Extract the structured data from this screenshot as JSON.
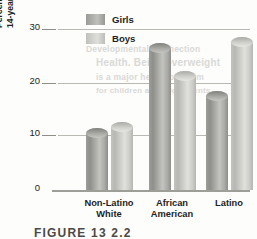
{
  "figure": {
    "caption": "FIGURE 13  2.2",
    "background_text": [
      "Developmental Connection",
      "Health. Being overweight",
      "is a major health problem",
      "for children and adolescents."
    ]
  },
  "chart_data": {
    "type": "bar",
    "title": "",
    "xlabel": "",
    "ylabel": "Percentage of overweight 11- to 14-year-olds in the United States",
    "ylabel_lines": [
      "Percentage of overweight 11- to",
      "14-year-olds in the United States"
    ],
    "categories": [
      "Non-Latino White",
      "African American",
      "Latino"
    ],
    "category_lines": [
      [
        "Non-Latino",
        "White"
      ],
      [
        "African",
        "American"
      ],
      [
        "Latino",
        ""
      ]
    ],
    "series": [
      {
        "name": "Girls",
        "color": "#9a9a96",
        "values": [
          11,
          26,
          17.5
        ]
      },
      {
        "name": "Boys",
        "color": "#c8c8c4",
        "values": [
          12,
          21,
          27
        ]
      }
    ],
    "ylim": [
      0,
      30
    ],
    "yticks": [
      0,
      10,
      20,
      30
    ],
    "ytick_labels": [
      "0",
      "10",
      "20",
      "30"
    ],
    "grid": true,
    "grid_lines_at": [
      10,
      20,
      30
    ],
    "legend": [
      "Girls",
      "Boys"
    ],
    "legend_position": "top-center"
  }
}
